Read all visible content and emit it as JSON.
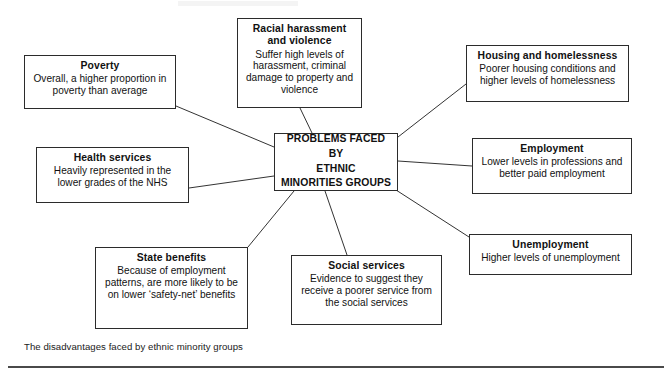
{
  "diagram": {
    "type": "spider-diagram",
    "caption": "The disadvantages faced by ethnic minority groups",
    "center": {
      "id": "center",
      "label": "PROBLEMS FACED BY ETHNIC MINORITIES GROUPS",
      "line1": "PROBLEMS FACED BY",
      "line2": "ETHNIC",
      "line3": "MINORITIES GROUPS"
    },
    "nodes": [
      {
        "id": "poverty",
        "title": "Poverty",
        "body": "Overall, a higher proportion in poverty than average"
      },
      {
        "id": "racial-harassment",
        "title": "Racial harassment and violence",
        "body": "Suffer high levels of harassment, criminal damage to property and violence"
      },
      {
        "id": "housing",
        "title": "Housing and homelessness",
        "body": "Poorer housing conditions and higher levels of homelessness"
      },
      {
        "id": "employment",
        "title": "Employment",
        "body": "Lower levels in professions and better paid employment"
      },
      {
        "id": "unemployment",
        "title": "Unemployment",
        "body": "Higher levels of unemployment"
      },
      {
        "id": "health-services",
        "title": "Health services",
        "body": "Heavily represented in the lower grades of the NHS"
      },
      {
        "id": "state-benefits",
        "title": "State benefits",
        "body": "Because of employment patterns, are more likely to be on lower ‘safety-net’ benefits"
      },
      {
        "id": "social-services",
        "title": "Social services",
        "body": "Evidence to suggest they receive a poorer service from the social services"
      }
    ],
    "colors": {
      "box_border": "#2b2b2b",
      "connector": "#333333",
      "text": "#111111",
      "background": "#ffffff",
      "rule": "#4a4a4a"
    }
  }
}
